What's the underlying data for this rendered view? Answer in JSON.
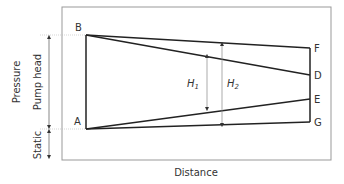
{
  "diagram": {
    "y_axis_outer_label": "Pressure",
    "pump_head_label": "Pump head",
    "static_label": "Static",
    "x_axis_label": "Distance",
    "points": {
      "A": "A",
      "B": "B",
      "D": "D",
      "E": "E",
      "F": "F",
      "G": "G"
    },
    "h1_label": "H",
    "h1_sub": "1",
    "h2_label": "H",
    "h2_sub": "2",
    "colors": {
      "line": "#222222",
      "frame": "#999999",
      "guide": "#bbbbbb",
      "text": "#333333"
    }
  }
}
